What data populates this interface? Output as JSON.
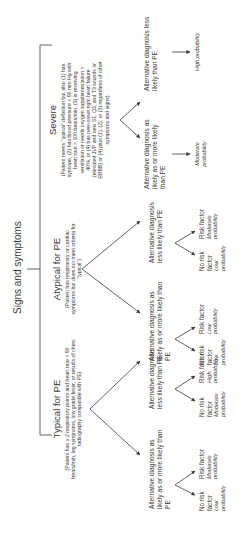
{
  "title": "Signs and symptoms",
  "branches": [
    {
      "name": "Typical for PE",
      "description": "(Patient has ≥ 2 respiratory points and heart rate > 90 beats/min, leg symptoms, low grade fever, or results of chest radiography compatible with PE)",
      "alternatives": [
        {
          "label": "Alternative diagnosis as likely as or more likely than PE",
          "leaves": [
            {
              "factor": "No risk factor",
              "probability": "Low probability"
            },
            {
              "factor": "Risk factor",
              "probability": "Moderate probability"
            }
          ]
        },
        {
          "label": "Alternative diagnosis less likely than PE",
          "leaves": [
            {
              "factor": "No risk factor",
              "probability": "Moderate probability"
            },
            {
              "factor": "Risk factor",
              "probability": "High probability"
            }
          ]
        }
      ]
    },
    {
      "name": "Atypical for PE",
      "description": "(Patient has respiratory or cardiac symptoms but does not meet criteria for \"typical\")",
      "alternatives": [
        {
          "label": "Alternative diagnosis as likely as or more likely than PE",
          "leaves": [
            {
              "factor": "No risk factor",
              "probability": "Low probability"
            },
            {
              "factor": "Risk factor",
              "probability": "Low probability"
            }
          ]
        },
        {
          "label": "Alternative diagnosis less likely than PE",
          "leaves": [
            {
              "factor": "No risk factor",
              "probability": "Low probability"
            },
            {
              "factor": "Risk factor",
              "probability": "Moderate probability"
            }
          ]
        }
      ]
    },
    {
      "name": "Severe",
      "description": "(Patient meets \"typical\" definition but also (1) has syncope, (2) has blood pressure < 90 mm Hg with heart rate > 100 beats/min, (3) is receiving ventilation or needs oxygen supplementation > 40%, or (4) has new-onset right heart failure (elevated JVP and new S1, Q3, and T3 sounds or RBBB) or (4) plus (1), (2), or (3) regardless of other symptoms and signs)",
      "alternatives": [
        {
          "label": "Alternative diagnosis as likely as or more likely than PE",
          "result": "Moderate probability"
        },
        {
          "label": "Alternative diagnosis less likely than PE",
          "result": "High probability"
        }
      ]
    }
  ]
}
